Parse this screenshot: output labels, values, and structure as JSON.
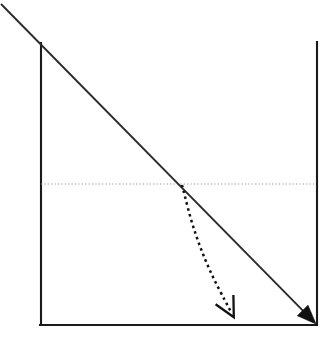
{
  "figure": {
    "title": "",
    "width": 335,
    "height": 350,
    "background_color": "#ffffff"
  },
  "chart_data": {
    "type": "line",
    "title": "",
    "xlabel": "",
    "ylabel": "",
    "grid": false,
    "legend_position": "none",
    "xlim": [
      0,
      335
    ],
    "ylim": [
      350,
      0
    ],
    "annotations": [
      {
        "name": "demand-curve",
        "label": "",
        "style": "solid",
        "color": "#2b2b2b",
        "arrow_head": "filled-triangle",
        "points": [
          [
            1,
            4
          ],
          [
            316,
            324
          ]
        ]
      },
      {
        "name": "price-level-line",
        "label": "",
        "style": "dotted",
        "color": "#8a8a8a",
        "arrow_head": "none",
        "points": [
          [
            41,
            184
          ],
          [
            316,
            184
          ]
        ]
      },
      {
        "name": "shift-arrow",
        "label": "",
        "style": "dashed",
        "color": "#111111",
        "arrow_head": "open-v",
        "points": [
          [
            182,
            185
          ],
          [
            193,
            228
          ],
          [
            209,
            270
          ],
          [
            231,
            312
          ]
        ]
      }
    ],
    "axes": {
      "left_axis": [
        [
          41,
          43
        ],
        [
          41,
          325
        ]
      ],
      "right_axis": [
        [
          317,
          42
        ],
        [
          317,
          325
        ]
      ],
      "bottom_axis": [
        [
          40,
          325
        ],
        [
          317,
          325
        ]
      ]
    },
    "intersection_point": [
      182,
      184
    ]
  },
  "labels": {
    "none": ""
  }
}
